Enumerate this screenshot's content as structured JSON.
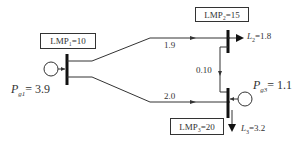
{
  "buses": [
    {
      "id": 1,
      "lmp_label": "LMP₁=10"
    },
    {
      "id": 2,
      "lmp_label": "LMP₂=15"
    },
    {
      "id": 3,
      "lmp_label": "LMP₃=20"
    }
  ],
  "generators": [
    {
      "bus": 1,
      "label_sym": "P",
      "label_sub": "g1",
      "label_val": "= 3.9"
    },
    {
      "bus": 3,
      "label_sym": "P",
      "label_sub": "g3",
      "label_val": "= 1.1"
    }
  ],
  "loads": [
    {
      "bus": 2,
      "label_sym": "L",
      "label_sub": "2",
      "label_val": "=1.8"
    },
    {
      "bus": 3,
      "label_sym": "L",
      "label_sub": "3",
      "label_val": "=3.2"
    }
  ],
  "flows": [
    {
      "from": 1,
      "to": 2,
      "value": "1.9"
    },
    {
      "from": 1,
      "to": 3,
      "value": "2.0"
    },
    {
      "from": 2,
      "to": 3,
      "value": "0.10"
    }
  ]
}
